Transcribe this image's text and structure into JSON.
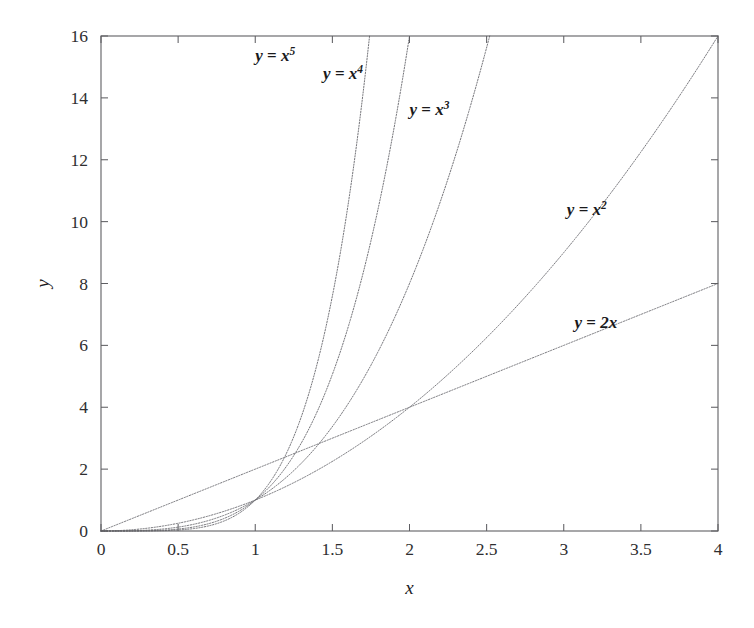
{
  "figure": {
    "background_color": "#ffffff",
    "axis_color": "#5f5f63",
    "curve_color": "#6e6e73",
    "text_color": "#1d1d1f"
  },
  "chart_data": {
    "type": "line",
    "title": "",
    "subtitle": "",
    "xlabel": "x",
    "ylabel": "y",
    "xlim": [
      0,
      4
    ],
    "ylim": [
      0,
      16
    ],
    "grid": false,
    "legend": "inline-curve-labels",
    "x_ticks": [
      0,
      0.5,
      1,
      1.5,
      2,
      2.5,
      3,
      3.5,
      4
    ],
    "x_tick_labels": [
      "0",
      "0.5",
      "1",
      "1.5",
      "2",
      "2.5",
      "3",
      "3.5",
      "4"
    ],
    "y_ticks": [
      0,
      2,
      4,
      6,
      8,
      10,
      12,
      14,
      16
    ],
    "y_tick_labels": [
      "0",
      "2",
      "4",
      "6",
      "8",
      "10",
      "12",
      "14",
      "16"
    ],
    "series": [
      {
        "name": "y = 2x",
        "label_base": "y = 2x",
        "label_sup": "",
        "exponent": 1,
        "coefficient": 2,
        "formula": "y = 2*x",
        "x": [
          0,
          0.5,
          1,
          1.5,
          2,
          2.5,
          3,
          3.5,
          4
        ],
        "values": [
          0,
          1,
          2,
          3,
          4,
          5,
          6,
          7,
          8
        ],
        "label_x": 3.07,
        "label_y": 6.55
      },
      {
        "name": "y = x^2",
        "label_base": "y = x",
        "label_sup": "2",
        "exponent": 2,
        "coefficient": 1,
        "formula": "y = x^2",
        "x": [
          0,
          0.5,
          1,
          1.5,
          2,
          2.5,
          3,
          3.5,
          4
        ],
        "values": [
          0,
          0.25,
          1,
          2.25,
          4,
          6.25,
          9,
          12.25,
          16
        ],
        "label_x": 3.02,
        "label_y": 10.2
      },
      {
        "name": "y = x^3",
        "label_base": "y = x",
        "label_sup": "3",
        "exponent": 3,
        "coefficient": 1,
        "formula": "y = x^3",
        "x": [
          0,
          0.5,
          1,
          1.5,
          2,
          2.5198
        ],
        "values": [
          0,
          0.125,
          1,
          3.375,
          8,
          16
        ],
        "label_x": 2.0,
        "label_y": 13.45
      },
      {
        "name": "y = x^4",
        "label_base": "y = x",
        "label_sup": "4",
        "exponent": 4,
        "coefficient": 1,
        "formula": "y = x^4",
        "x": [
          0,
          0.5,
          1,
          1.5,
          2
        ],
        "values": [
          0,
          0.0625,
          1,
          5.0625,
          16
        ],
        "label_x": 1.44,
        "label_y": 14.6
      },
      {
        "name": "y = x^5",
        "label_base": "y = x",
        "label_sup": "5",
        "exponent": 5,
        "coefficient": 1,
        "formula": "y = x^5",
        "x": [
          0,
          0.5,
          1,
          1.5,
          1.7411
        ],
        "values": [
          0,
          0.03125,
          1,
          7.59375,
          16
        ],
        "label_x": 1.0,
        "label_y": 15.2
      }
    ]
  }
}
